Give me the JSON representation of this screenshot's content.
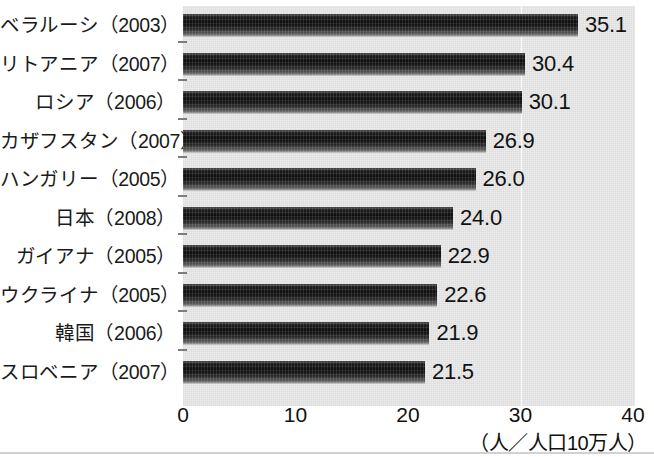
{
  "chart_data": {
    "type": "bar",
    "orientation": "horizontal",
    "title": "",
    "xlabel": "（人／人口10万人）",
    "ylabel": "",
    "xlim": [
      0,
      40
    ],
    "xticks": [
      0,
      10,
      20,
      30,
      40
    ],
    "xtick_labels": [
      "0",
      "10",
      "20",
      "30",
      "40"
    ],
    "grid": false,
    "legend": "none",
    "categories": [
      "ベラルーシ（2003）",
      "リトアニア（2007）",
      "ロシア（2006）",
      "カザフスタン（2007）",
      "ハンガリー（2005）",
      "日本（2008）",
      "ガイアナ（2005）",
      "ウクライナ（2005）",
      "韓国（2006）",
      "スロベニア（2007）"
    ],
    "values": [
      35.1,
      30.4,
      30.1,
      26.9,
      26.0,
      24.0,
      22.9,
      22.6,
      21.9,
      21.5
    ],
    "value_labels": [
      "35.1",
      "30.4",
      "30.1",
      "26.9",
      "26.0",
      "24.0",
      "22.9",
      "22.6",
      "21.9",
      "21.5"
    ]
  },
  "axis": {
    "unit_label": "（人／人口10万人）",
    "gridline_value": 30
  },
  "colors": {
    "bar_dark": "#0d0d0d",
    "bar_light": "#8d8d8d",
    "plot_background": "#ececed",
    "text": "#121212"
  }
}
